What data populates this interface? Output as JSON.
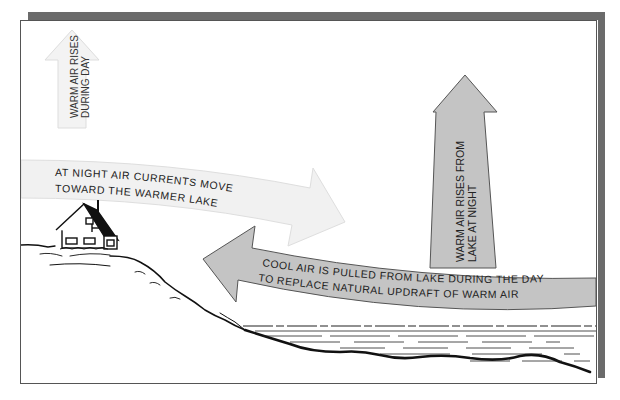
{
  "diagram": {
    "labels": {
      "warm_air_day": [
        "WARM AIR RISES",
        "DURING DAY"
      ],
      "night_currents": [
        "AT NIGHT AIR CURRENTS MOVE",
        "TOWARD THE WARMER LAKE"
      ],
      "warm_air_night": [
        "WARM AIR RISES FROM",
        "LAKE AT NIGHT"
      ],
      "cool_air_day": [
        "COOL AIR IS PULLED FROM LAKE DURING THE DAY",
        "TO REPLACE NATURAL UPDRAFT OF WARM AIR"
      ]
    },
    "colors": {
      "frame_shadow": "#6b6b6b",
      "white_arrow_fill": "#f1f1f1",
      "white_arrow_stroke": "#d8d8d8",
      "gray_arrow_fill": "#c4c4c4",
      "gray_arrow_stroke": "#555555",
      "ink": "#111111"
    }
  }
}
